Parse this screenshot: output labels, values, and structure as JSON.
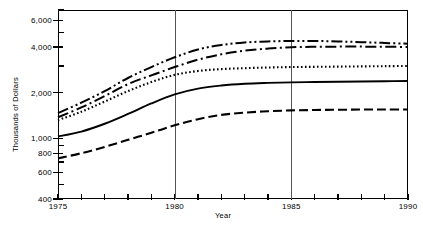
{
  "chart_data": {
    "type": "line",
    "title": "",
    "xlabel": "Year",
    "ylabel": "Thousands of Dollars",
    "yscale": "log",
    "ylim": [
      400,
      7000
    ],
    "xlim": [
      1975,
      1990
    ],
    "grid": "vertical-at-1980-and-1985",
    "legend": "none",
    "y_tick_labels": [
      "400",
      "600",
      "800",
      "1,000",
      "2,000",
      "4,000",
      "6,000"
    ],
    "y_tick_values": [
      400,
      600,
      800,
      1000,
      2000,
      4000,
      6000
    ],
    "y_minor_ticks": [
      500,
      700,
      900,
      3000,
      5000,
      7000
    ],
    "x_tick_labels": [
      "1975",
      "1980",
      "1985",
      "1990"
    ],
    "x_tick_values": [
      1975,
      1980,
      1985,
      1990
    ],
    "x_minor_ticks": [
      1976,
      1977,
      1978,
      1979,
      1981,
      1982,
      1983,
      1984,
      1986,
      1987,
      1988,
      1989
    ],
    "x": [
      1975,
      1976,
      1977,
      1978,
      1979,
      1980,
      1981,
      1982,
      1983,
      1984,
      1985,
      1986,
      1987,
      1988,
      1989,
      1990
    ],
    "series": [
      {
        "name": "series-1",
        "style": "dash-dot-dot",
        "values": [
          1470,
          1720,
          2050,
          2500,
          2950,
          3420,
          3850,
          4120,
          4280,
          4350,
          4380,
          4380,
          4350,
          4300,
          4250,
          4200
        ]
      },
      {
        "name": "series-2",
        "style": "dash-dot",
        "values": [
          1380,
          1600,
          1900,
          2280,
          2600,
          2950,
          3300,
          3580,
          3780,
          3900,
          3980,
          4010,
          4020,
          4020,
          4010,
          4000
        ]
      },
      {
        "name": "series-3",
        "style": "dotted",
        "values": [
          1320,
          1500,
          1750,
          2050,
          2350,
          2620,
          2780,
          2860,
          2900,
          2930,
          2950,
          2960,
          2970,
          2980,
          2990,
          3000
        ]
      },
      {
        "name": "series-4",
        "style": "solid",
        "values": [
          1030,
          1110,
          1250,
          1450,
          1700,
          1950,
          2130,
          2230,
          2290,
          2320,
          2340,
          2350,
          2360,
          2370,
          2380,
          2390
        ]
      },
      {
        "name": "series-5",
        "style": "dashed",
        "values": [
          740,
          800,
          880,
          980,
          1090,
          1220,
          1340,
          1430,
          1480,
          1510,
          1530,
          1540,
          1545,
          1550,
          1550,
          1550
        ]
      }
    ]
  },
  "axes": {
    "y_title": "Thousands of Dollars",
    "x_title": "Year"
  }
}
